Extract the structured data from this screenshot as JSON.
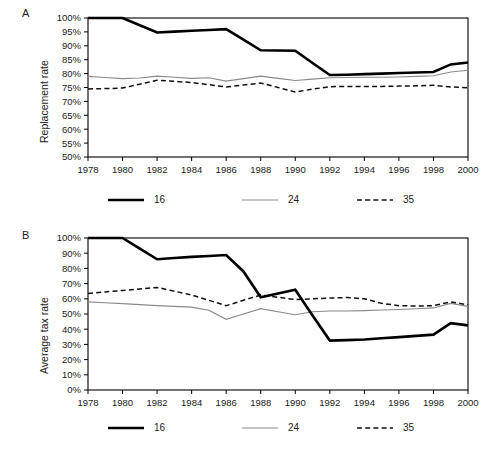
{
  "figure": {
    "background": "#ffffff",
    "line_color_16": "#000000",
    "line_color_24": "#8a8a8a",
    "line_color_35": "#111111"
  },
  "panels": [
    {
      "letter": "A",
      "ylabel": "Replacement rate"
    },
    {
      "letter": "B",
      "ylabel": "Average tax rate"
    }
  ],
  "legend": {
    "items": [
      {
        "label": "16",
        "style": "thick-solid"
      },
      {
        "label": "24",
        "style": "thin-solid"
      },
      {
        "label": "35",
        "style": "dashed"
      }
    ]
  },
  "chart_data": [
    {
      "type": "line",
      "panel": "A",
      "title": "",
      "xlabel": "",
      "ylabel": "Replacement rate",
      "x": [
        1978,
        1979,
        1980,
        1981,
        1982,
        1983,
        1984,
        1985,
        1986,
        1987,
        1988,
        1989,
        1990,
        1991,
        1992,
        1993,
        1994,
        1995,
        1996,
        1997,
        1998,
        1999,
        2000
      ],
      "xticks": [
        1978,
        1980,
        1982,
        1984,
        1986,
        1988,
        1990,
        1992,
        1994,
        1996,
        1998,
        2000
      ],
      "xlim": [
        1978,
        2000
      ],
      "ylim": [
        50,
        100
      ],
      "yticks": [
        50,
        55,
        60,
        65,
        70,
        75,
        80,
        85,
        90,
        95,
        100
      ],
      "ytick_labels": [
        "50%",
        "55%",
        "60%",
        "65%",
        "70%",
        "75%",
        "80%",
        "85%",
        "90%",
        "95%",
        "100%"
      ],
      "grid": false,
      "legend_position": "below",
      "series": [
        {
          "name": "16",
          "values": [
            100.0,
            100.0,
            100.0,
            97.4,
            94.8,
            95.1,
            95.4,
            95.7,
            96.0,
            92.2,
            88.4,
            88.3,
            88.2,
            83.8,
            79.5,
            79.6,
            79.8,
            80.0,
            80.2,
            80.4,
            80.6,
            83.3,
            84.0
          ]
        },
        {
          "name": "24",
          "values": [
            79.0,
            78.6,
            78.2,
            78.4,
            79.1,
            78.7,
            78.3,
            78.5,
            77.3,
            78.2,
            79.1,
            78.3,
            77.5,
            78.0,
            78.5,
            78.6,
            78.7,
            78.7,
            78.8,
            79.0,
            79.2,
            80.6,
            81.2
          ]
        },
        {
          "name": "35",
          "values": [
            74.5,
            74.6,
            74.8,
            76.2,
            77.6,
            77.2,
            76.8,
            76.0,
            75.2,
            75.9,
            76.6,
            75.0,
            73.4,
            74.4,
            75.3,
            75.4,
            75.4,
            75.4,
            75.5,
            75.6,
            75.8,
            75.2,
            74.9
          ]
        }
      ]
    },
    {
      "type": "line",
      "panel": "B",
      "title": "",
      "xlabel": "",
      "ylabel": "Average tax rate",
      "x": [
        1978,
        1979,
        1980,
        1981,
        1982,
        1983,
        1984,
        1985,
        1986,
        1987,
        1988,
        1989,
        1990,
        1991,
        1992,
        1993,
        1994,
        1995,
        1996,
        1997,
        1998,
        1999,
        2000
      ],
      "xticks": [
        1978,
        1980,
        1982,
        1984,
        1986,
        1988,
        1990,
        1992,
        1994,
        1996,
        1998,
        2000
      ],
      "xlim": [
        1978,
        2000
      ],
      "ylim": [
        0,
        100
      ],
      "yticks": [
        0,
        10,
        20,
        30,
        40,
        50,
        60,
        70,
        80,
        90,
        100
      ],
      "ytick_labels": [
        "0%",
        "10%",
        "20%",
        "30%",
        "40%",
        "50%",
        "60%",
        "70%",
        "80%",
        "90%",
        "100%"
      ],
      "grid": false,
      "legend_position": "below",
      "series": [
        {
          "name": "16",
          "values": [
            100.0,
            100.0,
            100.0,
            93.0,
            86.0,
            86.8,
            87.6,
            88.2,
            88.8,
            78.0,
            61.0,
            63.5,
            66.0,
            49.0,
            32.5,
            32.8,
            33.2,
            34.0,
            34.8,
            35.6,
            36.4,
            44.0,
            42.5
          ]
        },
        {
          "name": "24",
          "values": [
            58.0,
            57.4,
            56.8,
            56.2,
            55.5,
            55.0,
            54.5,
            52.5,
            46.5,
            50.0,
            53.5,
            51.5,
            49.5,
            51.5,
            52.0,
            52.0,
            52.2,
            52.6,
            53.0,
            53.5,
            54.0,
            57.0,
            55.0
          ]
        },
        {
          "name": "35",
          "values": [
            63.5,
            64.5,
            65.5,
            66.5,
            67.5,
            65.0,
            62.5,
            59.0,
            55.5,
            59.0,
            62.5,
            61.0,
            59.5,
            60.0,
            60.5,
            60.8,
            60.0,
            57.0,
            55.5,
            55.2,
            55.5,
            58.0,
            56.0
          ]
        }
      ]
    }
  ]
}
